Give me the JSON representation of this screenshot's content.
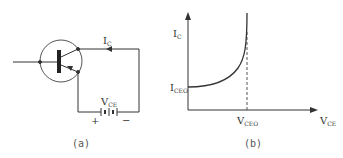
{
  "panel_a": {
    "caption": "(a)",
    "current_label": {
      "main": "I",
      "sub": "C"
    },
    "voltage_label": {
      "main": "V",
      "sub": "CE"
    },
    "plus_sign": "+",
    "minus_sign": "−"
  },
  "panel_b": {
    "caption": "(b)",
    "y_axis_label": {
      "main": "I",
      "sub": "C"
    },
    "x_axis_label": {
      "main": "V",
      "sub": "CE"
    },
    "y_marker_label": {
      "main": "I",
      "sub": "CEO"
    },
    "x_marker_label": {
      "main": "V",
      "sub": "CEO"
    }
  },
  "colors": {
    "stroke": "#333333",
    "background": "#ffffff"
  }
}
